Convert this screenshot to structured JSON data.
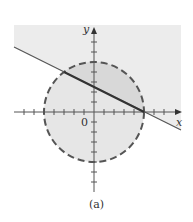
{
  "figure": {
    "caption": "(a)",
    "axes": {
      "x_label": "x",
      "y_label": "y",
      "origin_label": "0",
      "tick_spacing_units": 1,
      "x_ticks_range": [
        -7,
        8
      ],
      "y_ticks_range": [
        -8,
        7
      ]
    },
    "circle": {
      "equation": "x^2 + y^2 = 25",
      "center": [
        0,
        0
      ],
      "radius": 5,
      "style": "dashed",
      "interior_shaded": true
    },
    "line": {
      "equation": "x + 2y = 5",
      "slope": -0.5,
      "intercepts": {
        "x": 5,
        "y": 2.5
      },
      "region_above_shaded": true
    },
    "intersections": [
      [
        -3,
        4
      ],
      [
        5,
        0
      ]
    ],
    "colors": {
      "shade": "#ececec",
      "overlap_shade": "#dcdcdc",
      "axis": "#555555",
      "line": "#444444",
      "circle": "#555555"
    }
  }
}
